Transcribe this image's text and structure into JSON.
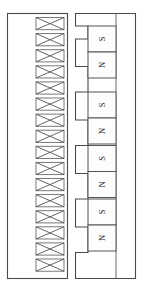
{
  "diagram": {
    "background_color": "#ffffff",
    "line_color": "#4a4a4a",
    "stator": {
      "name": "stator-assembly",
      "frame": {
        "x": 7,
        "y": 13,
        "width": 61,
        "height": 266
      },
      "slot_count": 16,
      "coil_symbol": "cross",
      "slot_geometry": {
        "x": 36,
        "width": 28,
        "height": 12.2,
        "pitch": 16.1,
        "first_y": 17.5
      },
      "slots": [
        {
          "index": 1,
          "label": "X"
        },
        {
          "index": 2,
          "label": "X"
        },
        {
          "index": 3,
          "label": "X"
        },
        {
          "index": 4,
          "label": "X"
        },
        {
          "index": 5,
          "label": "X"
        },
        {
          "index": 6,
          "label": "X"
        },
        {
          "index": 7,
          "label": "X"
        },
        {
          "index": 8,
          "label": "X"
        },
        {
          "index": 9,
          "label": "X"
        },
        {
          "index": 10,
          "label": "X"
        },
        {
          "index": 11,
          "label": "X"
        },
        {
          "index": 12,
          "label": "X"
        },
        {
          "index": 13,
          "label": "X"
        },
        {
          "index": 14,
          "label": "X"
        },
        {
          "index": 15,
          "label": "X"
        },
        {
          "index": 16,
          "label": "X"
        }
      ]
    },
    "rotor": {
      "name": "mover-assembly",
      "frame": {
        "x": 75,
        "y": 13,
        "width": 61,
        "height": 266
      },
      "back_iron_x": 116,
      "yoke_path": "M 75,13 L 136,13 L 136,279 L 75,279 L 75,253 L 88,253 L 88,228 L 75,228 L 75,200 L 88,200 L 88,175 L 75,175 L 75,147 L 88,147 L 88,122 L 75,122 L 75,95 L 88,95 L 88,70 L 75,70 L 75,41 L 88,41 L 88,18 L 75,18 Z",
      "magnet_pair_count": 4,
      "magnet_geometry": {
        "x": 88,
        "width": 28,
        "cell_height": 26,
        "first_y": 27,
        "pitch": 64.5
      },
      "magnet_pairs": [
        {
          "index": 1,
          "top_pole": "S",
          "bottom_pole": "N"
        },
        {
          "index": 2,
          "top_pole": "S",
          "bottom_pole": "N"
        },
        {
          "index": 3,
          "top_pole": "S",
          "bottom_pole": "N"
        },
        {
          "index": 4,
          "top_pole": "S",
          "bottom_pole": "N"
        }
      ]
    }
  }
}
